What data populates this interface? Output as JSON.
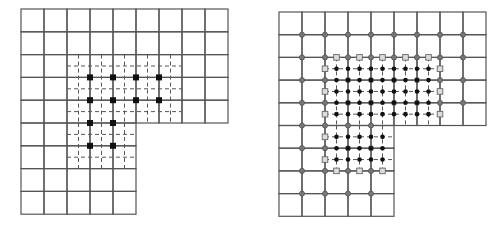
{
  "colors": {
    "background": "#ffffff",
    "grid": "#555555",
    "fine_dash": "#444444",
    "node": "#111111",
    "circle_fill": "#777777",
    "square_stroke": "#666666"
  },
  "figures": [
    {
      "name": "left-grid-figure",
      "origin": [
        21,
        9
      ],
      "cell": [
        23,
        22.8
      ],
      "coarse_rows": [
        {
          "row_top": 0,
          "cols": 9
        },
        {
          "row_top": 1,
          "cols": 9
        },
        {
          "row_top": 2,
          "cols": 9
        },
        {
          "row_top": 3,
          "cols": 9
        },
        {
          "row_top": 4,
          "cols": 9
        },
        {
          "row_top": 5,
          "cols": 5
        },
        {
          "row_top": 6,
          "cols": 5
        },
        {
          "row_top": 7,
          "cols": 5
        },
        {
          "row_top": 8,
          "cols": 5
        }
      ],
      "fine_regions": [
        {
          "x0": 2,
          "y0": 2,
          "x1": 7,
          "y1": 5
        },
        {
          "x0": 2,
          "y0": 5,
          "x1": 5,
          "y1": 7
        }
      ],
      "square_nodes": [
        [
          3,
          3
        ],
        [
          4,
          3
        ],
        [
          5,
          3
        ],
        [
          6,
          3
        ],
        [
          3,
          4
        ],
        [
          4,
          4
        ],
        [
          5,
          4
        ],
        [
          6,
          4
        ],
        [
          3,
          5
        ],
        [
          4,
          5
        ],
        [
          3,
          6
        ],
        [
          4,
          6
        ]
      ],
      "circle_nodes": [],
      "boundary_squares": [],
      "fine_dots": false
    },
    {
      "name": "right-grid-figure",
      "origin": [
        279,
        12
      ],
      "cell": [
        23,
        22.7
      ],
      "coarse_rows": [
        {
          "row_top": 0,
          "cols": 9
        },
        {
          "row_top": 1,
          "cols": 9
        },
        {
          "row_top": 2,
          "cols": 9
        },
        {
          "row_top": 3,
          "cols": 9
        },
        {
          "row_top": 4,
          "cols": 9
        },
        {
          "row_top": 5,
          "cols": 5
        },
        {
          "row_top": 6,
          "cols": 5
        },
        {
          "row_top": 7,
          "cols": 5
        },
        {
          "row_top": 8,
          "cols": 5
        }
      ],
      "fine_regions": [
        {
          "x0": 2,
          "y0": 2,
          "x1": 7,
          "y1": 5
        },
        {
          "x0": 2,
          "y0": 5,
          "x1": 5,
          "y1": 7
        }
      ],
      "square_nodes": [],
      "circle_nodes": "auto",
      "boundary_squares": "auto",
      "fine_dots": true
    }
  ]
}
